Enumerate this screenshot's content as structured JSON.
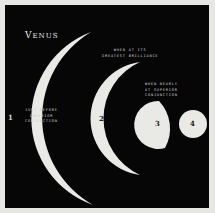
{
  "diagram": {
    "title": "Venus",
    "title_initial": "V",
    "title_rest": "ENUS",
    "colors": {
      "background": "#060606",
      "border": "#e6e6e2",
      "planet": "#e9e9e6",
      "text": "#cfcfcf"
    },
    "phases": [
      {
        "number": "1",
        "shape": "thin crescent",
        "caption": "JUST BEFORE\nINFERIOR\nCONJUNCTION"
      },
      {
        "number": "2",
        "shape": "crescent",
        "caption": "WHEN AT ITS\nGREATEST BRILLIANCE"
      },
      {
        "number": "3",
        "shape": "gibbous",
        "caption": "WHEN NEARLY\nAT SUPERIOR\nCONJUNCTION"
      },
      {
        "number": "4",
        "shape": "full",
        "caption": ""
      }
    ],
    "caption_3_line1": "WHEN NEARLY",
    "caption_3_line2": "AT SUPERIOR\nCONJUNCTION"
  }
}
